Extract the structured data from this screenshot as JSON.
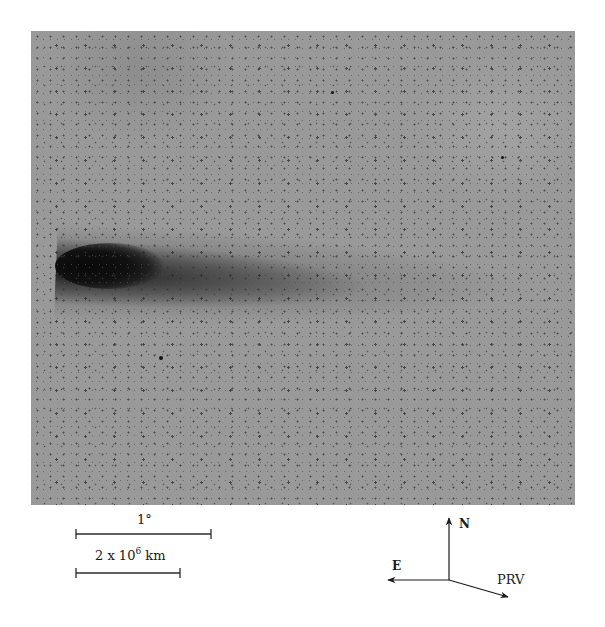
{
  "figure": {
    "type": "astronomical photograph (negative) of a comet",
    "photo": {
      "background_color": "#9b9b9b",
      "nucleus_color": "#0a0a0a",
      "description": "Dark comet head at left with tail extending to the right"
    },
    "scale_bars": [
      {
        "label": "1°",
        "length_px": 135
      },
      {
        "label_base": "2 x 10",
        "label_exp": "6",
        "label_unit": "km",
        "length_px": 104
      }
    ],
    "compass": {
      "north_label": "N",
      "east_label": "E",
      "velocity_label": "PRV"
    }
  }
}
